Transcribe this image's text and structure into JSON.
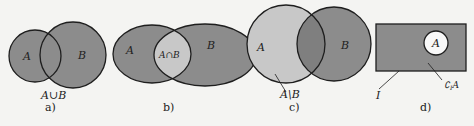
{
  "figure": {
    "colors": {
      "background": "#f4f4f2",
      "dark_fill": "#8c8c8c",
      "light_fill": "#c8c8c8",
      "white_fill": "#f8f8f8",
      "stroke": "#1e1e1e"
    },
    "panels": [
      {
        "id": "a",
        "caption": "a)",
        "set_a_label": "A",
        "set_b_label": "B",
        "operation_label": "A∪B",
        "operation": "union"
      },
      {
        "id": "b",
        "caption": "b)",
        "set_a_label": "A",
        "set_b_label": "B",
        "operation_label": "A∩B",
        "operation": "intersection"
      },
      {
        "id": "c",
        "caption": "c)",
        "set_a_label": "A",
        "set_b_label": "B",
        "operation_label": "A\\B",
        "operation": "difference"
      },
      {
        "id": "d",
        "caption": "d)",
        "set_a_label": "A",
        "universe_label": "I",
        "operation_label": "∁",
        "operation_label_sub": "I",
        "operation_label_set": "A",
        "operation": "complement"
      }
    ]
  }
}
